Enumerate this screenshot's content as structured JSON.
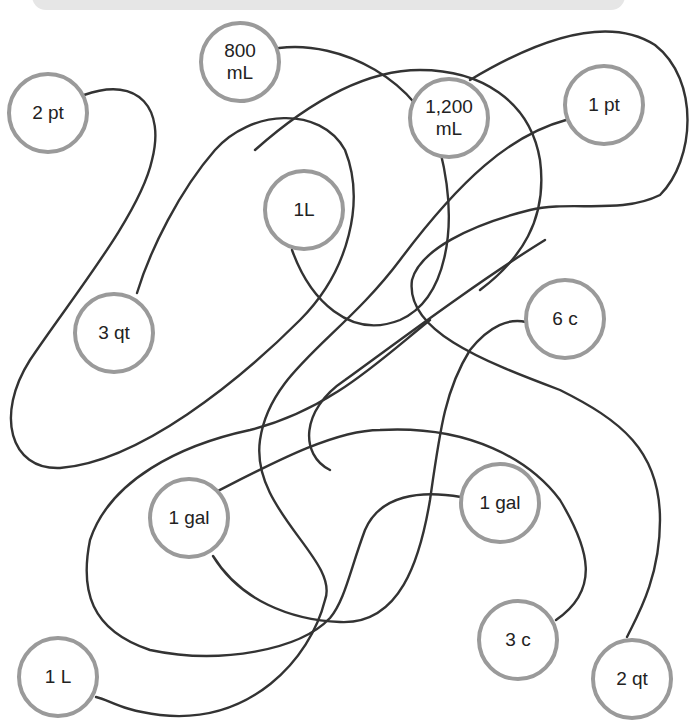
{
  "banner": {
    "color": "#e6e6e6"
  },
  "style": {
    "node_border_color": "#9a9a9a",
    "curve_color": "#333333",
    "text_color": "#222222",
    "background": "#ffffff"
  },
  "nodes": [
    {
      "id": "n2pt",
      "label": "2 pt",
      "cx": 48,
      "cy": 113
    },
    {
      "id": "n800ml",
      "label": "800\nmL",
      "cx": 240,
      "cy": 62
    },
    {
      "id": "n1200ml",
      "label": "1,200\nmL",
      "cx": 449,
      "cy": 118
    },
    {
      "id": "n1pt",
      "label": "1 pt",
      "cx": 604,
      "cy": 105
    },
    {
      "id": "n1l_a",
      "label": "1L",
      "cx": 304,
      "cy": 210
    },
    {
      "id": "n3qt",
      "label": "3 qt",
      "cx": 114,
      "cy": 333
    },
    {
      "id": "n6c",
      "label": "6 c",
      "cx": 565,
      "cy": 319
    },
    {
      "id": "n1gal_a",
      "label": "1 gal",
      "cx": 189,
      "cy": 518
    },
    {
      "id": "n1gal_b",
      "label": "1 gal",
      "cx": 500,
      "cy": 503
    },
    {
      "id": "n3c",
      "label": "3 c",
      "cx": 518,
      "cy": 640
    },
    {
      "id": "n2qt",
      "label": "2 qt",
      "cx": 632,
      "cy": 679
    },
    {
      "id": "n1l_b",
      "label": "1 L",
      "cx": 58,
      "cy": 677
    }
  ],
  "connections": [
    {
      "from": "2 pt",
      "to": "3 qt"
    },
    {
      "from": "800 mL",
      "to": "1L"
    },
    {
      "from": "1,200 mL",
      "to": "6 c"
    },
    {
      "from": "1 pt",
      "to": "1 L"
    },
    {
      "from": "1 gal",
      "to": "2 qt"
    },
    {
      "from": "1 gal",
      "to": "3 c"
    }
  ]
}
